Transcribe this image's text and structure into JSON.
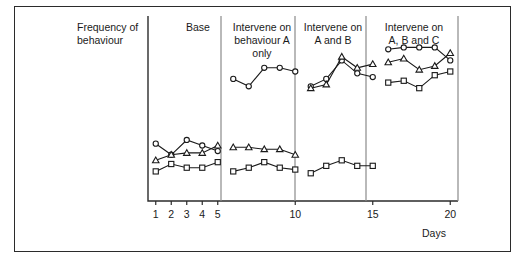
{
  "figure": {
    "y_axis_label_line1": "Frequency of",
    "y_axis_label_line2": "behaviour",
    "x_axis_label": "Days"
  },
  "panels": [
    {
      "id": "base",
      "title_lines": [
        "Base"
      ]
    },
    {
      "id": "intervene-a",
      "title_lines": [
        "Intervene on",
        "behaviour A",
        "only"
      ]
    },
    {
      "id": "intervene-ab",
      "title_lines": [
        "Intervene on",
        "A and B"
      ]
    },
    {
      "id": "intervene-abc",
      "title_lines": [
        "Intervene on",
        "A, B and C"
      ]
    }
  ],
  "chart_data": {
    "type": "line",
    "title": "Frequency of behaviour",
    "xlabel": "Days",
    "ylabel": "Frequency of behaviour",
    "xlim": [
      0.5,
      20.5
    ],
    "ylim": [
      0,
      10
    ],
    "grid": false,
    "legend": "none",
    "x_tick_labels": [
      "1",
      "2",
      "3",
      "4",
      "5",
      "10",
      "15",
      "20"
    ],
    "x_tick_values": [
      1,
      2,
      3,
      4,
      5,
      10,
      15,
      20
    ],
    "phases": [
      {
        "name": "Base",
        "x_start": 1,
        "x_end": 5
      },
      {
        "name": "Intervene on behaviour A only",
        "x_start": 6,
        "x_end": 10
      },
      {
        "name": "Intervene on A and B",
        "x_start": 11,
        "x_end": 15
      },
      {
        "name": "Intervene on A, B and C",
        "x_start": 16,
        "x_end": 20
      }
    ],
    "x": [
      1,
      2,
      3,
      4,
      5,
      6,
      7,
      8,
      9,
      10,
      11,
      12,
      13,
      14,
      15,
      16,
      17,
      18,
      19,
      20
    ],
    "series": [
      {
        "name": "Behaviour A",
        "marker": "circle",
        "values": [
          3.1,
          2.5,
          3.3,
          3.0,
          2.7,
          6.6,
          6.2,
          7.2,
          7.2,
          7.0,
          6.2,
          6.6,
          7.6,
          6.9,
          6.7,
          8.2,
          8.3,
          8.3,
          8.3,
          7.6
        ]
      },
      {
        "name": "Behaviour B",
        "marker": "triangle",
        "values": [
          2.2,
          2.5,
          2.6,
          2.6,
          3.0,
          2.9,
          2.9,
          2.8,
          2.8,
          2.5,
          6.1,
          6.3,
          7.8,
          7.2,
          7.4,
          7.5,
          7.7,
          7.1,
          7.3,
          8.0
        ]
      },
      {
        "name": "Behaviour C",
        "marker": "square",
        "values": [
          1.6,
          2.0,
          1.8,
          1.8,
          2.1,
          1.6,
          1.8,
          2.1,
          1.8,
          1.7,
          1.5,
          1.9,
          2.2,
          1.9,
          1.9,
          6.4,
          6.5,
          6.1,
          6.8,
          7.0
        ]
      }
    ]
  },
  "colors": {
    "frame": "#2b2b2b",
    "axis": "#2b2b2b",
    "divider": "#8a8a8a",
    "data": "#1a1a1a",
    "background": "#ffffff"
  }
}
